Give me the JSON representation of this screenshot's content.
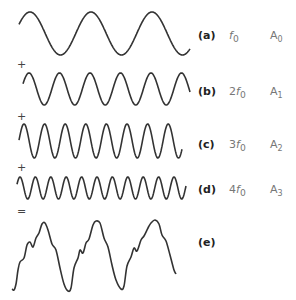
{
  "figure": {
    "rows": [
      {
        "id": "a",
        "label": "(a)",
        "freq_coef": "",
        "freq_sym": "f",
        "freq_sub": "0",
        "amp_sym": "A",
        "amp_sub": "0",
        "label_y": 30
      },
      {
        "id": "b",
        "label": "(b)",
        "freq_coef": "2",
        "freq_sym": "f",
        "freq_sub": "0",
        "amp_sym": "A",
        "amp_sub": "1",
        "label_y": 86
      },
      {
        "id": "c",
        "label": "(c)",
        "freq_coef": "3",
        "freq_sym": "f",
        "freq_sub": "0",
        "amp_sym": "A",
        "amp_sub": "2",
        "label_y": 139
      },
      {
        "id": "d",
        "label": "(d)",
        "freq_coef": "4",
        "freq_sym": "f",
        "freq_sub": "0",
        "amp_sym": "A",
        "amp_sub": "3",
        "label_y": 184
      },
      {
        "id": "e",
        "label": "(e)",
        "label_y": 237
      }
    ],
    "operators": [
      {
        "symbol": "+",
        "y": 59
      },
      {
        "symbol": "+",
        "y": 111
      },
      {
        "symbol": "+",
        "y": 162
      },
      {
        "symbol": "=",
        "y": 206
      }
    ]
  },
  "waves": [
    {
      "id": "a",
      "x0": 19,
      "x1": 190,
      "center": 33.5,
      "amp": 21.5,
      "period": 61,
      "phase_x": 30
    },
    {
      "id": "b",
      "x0": 23,
      "x1": 190,
      "center": 89,
      "amp": 16,
      "period": 30.5,
      "phase_x": 29
    },
    {
      "id": "c",
      "x0": 19,
      "x1": 182,
      "center": 141,
      "amp": 17,
      "period": 20.6,
      "phase_x": 24
    },
    {
      "id": "d",
      "x0": 17,
      "x1": 186,
      "center": 188,
      "amp": 11,
      "period": 15.4,
      "phase_x": 20
    }
  ],
  "sum_wave": {
    "points": [
      [
        12,
        289
      ],
      [
        14,
        290
      ],
      [
        16,
        284
      ],
      [
        18,
        270
      ],
      [
        20,
        262
      ],
      [
        24,
        258
      ],
      [
        27,
        245
      ],
      [
        30,
        242
      ],
      [
        33,
        247
      ],
      [
        36,
        238
      ],
      [
        39,
        233
      ],
      [
        42,
        224
      ],
      [
        45,
        223
      ],
      [
        48,
        230
      ],
      [
        52,
        244
      ],
      [
        56,
        250
      ],
      [
        60,
        268
      ],
      [
        64,
        284
      ],
      [
        68,
        291
      ],
      [
        71,
        288
      ],
      [
        74,
        268
      ],
      [
        78,
        258
      ],
      [
        80,
        250
      ],
      [
        83,
        253
      ],
      [
        86,
        243
      ],
      [
        89,
        239
      ],
      [
        93,
        225
      ],
      [
        96,
        221
      ],
      [
        100,
        223
      ],
      [
        104,
        238
      ],
      [
        108,
        247
      ],
      [
        112,
        265
      ],
      [
        116,
        280
      ],
      [
        121,
        289
      ],
      [
        124,
        286
      ],
      [
        127,
        266
      ],
      [
        131,
        257
      ],
      [
        134,
        248
      ],
      [
        137,
        251
      ],
      [
        141,
        240
      ],
      [
        144,
        236
      ],
      [
        148,
        228
      ],
      [
        151,
        223
      ],
      [
        155,
        220
      ],
      [
        159,
        224
      ],
      [
        162,
        235
      ],
      [
        166,
        241
      ],
      [
        170,
        255
      ],
      [
        174,
        270
      ],
      [
        176,
        274
      ]
    ],
    "stroke": "#333333"
  },
  "colors": {
    "stroke": "#333333",
    "label": "#222222",
    "muted": "#777777"
  }
}
